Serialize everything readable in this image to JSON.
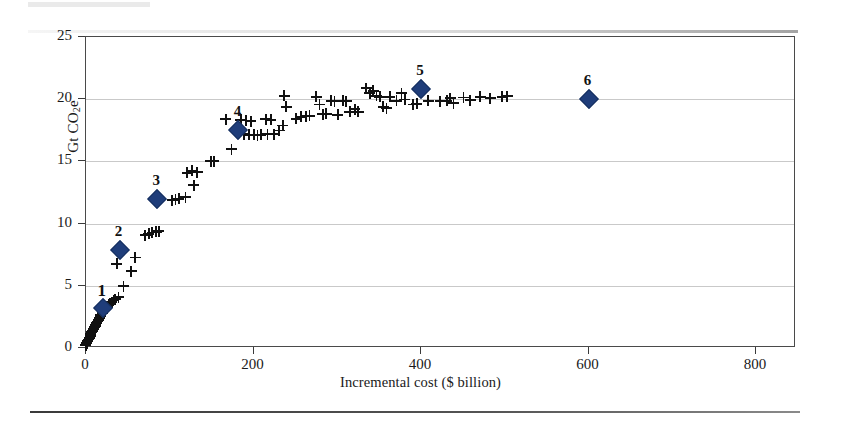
{
  "chart_data": {
    "type": "scatter",
    "title": "",
    "xlabel": "Incremental cost ($ billion)",
    "ylabel": "Gt CO2e",
    "ylabel_rich": "Gt CO<sub>2</sub>e",
    "xlim": [
      0,
      841
    ],
    "ylim": [
      0,
      25
    ],
    "xticks": [
      0,
      200,
      400,
      600,
      800
    ],
    "yticks": [
      0,
      5,
      10,
      15,
      20,
      25
    ],
    "xtick_labels": [
      "0",
      "200",
      "400",
      "600",
      "800"
    ],
    "ytick_labels": [
      "0",
      "5",
      "10",
      "15",
      "20",
      "25"
    ],
    "grid": "horizontal",
    "legend": "none",
    "series": [
      {
        "name": "abatement points",
        "marker": "plus",
        "color": "#111111",
        "points": [
          [
            1,
            0.15
          ],
          [
            2,
            0.3
          ],
          [
            3,
            0.45
          ],
          [
            4,
            0.6
          ],
          [
            5,
            0.75
          ],
          [
            6,
            0.9
          ],
          [
            7,
            1.05
          ],
          [
            8,
            1.2
          ],
          [
            9,
            1.3
          ],
          [
            10,
            1.45
          ],
          [
            11,
            1.6
          ],
          [
            12,
            1.7
          ],
          [
            13,
            1.8
          ],
          [
            14,
            1.95
          ],
          [
            15,
            2.05
          ],
          [
            16,
            2.2
          ],
          [
            17,
            2.3
          ],
          [
            18,
            2.45
          ],
          [
            19,
            2.6
          ],
          [
            21,
            2.75
          ],
          [
            22,
            2.9
          ],
          [
            24,
            3.05
          ],
          [
            26,
            3.2
          ],
          [
            28,
            3.35
          ],
          [
            30,
            3.5
          ],
          [
            32,
            3.6
          ],
          [
            34,
            3.75
          ],
          [
            36,
            3.85
          ],
          [
            40,
            4.0
          ],
          [
            38,
            6.7
          ],
          [
            46,
            4.9
          ],
          [
            55,
            6.1
          ],
          [
            60,
            7.2
          ],
          [
            72,
            9.0
          ],
          [
            76,
            9.1
          ],
          [
            80,
            9.2
          ],
          [
            85,
            9.25
          ],
          [
            88,
            9.3
          ],
          [
            104,
            11.8
          ],
          [
            108,
            11.85
          ],
          [
            112,
            11.9
          ],
          [
            120,
            12.05
          ],
          [
            122,
            14.0
          ],
          [
            128,
            14.15
          ],
          [
            134,
            14.05
          ],
          [
            130,
            13.0
          ],
          [
            150,
            14.95
          ],
          [
            154,
            14.95
          ],
          [
            168,
            18.3
          ],
          [
            175,
            15.9
          ],
          [
            186,
            18.25
          ],
          [
            192,
            18.2
          ],
          [
            198,
            18.15
          ],
          [
            190,
            17.1
          ],
          [
            196,
            17.05
          ],
          [
            202,
            17.05
          ],
          [
            206,
            17.0
          ],
          [
            210,
            17.05
          ],
          [
            216,
            18.3
          ],
          [
            222,
            18.25
          ],
          [
            218,
            17.1
          ],
          [
            226,
            17.1
          ],
          [
            238,
            20.2
          ],
          [
            240,
            19.3
          ],
          [
            236,
            17.8
          ],
          [
            232,
            17.4
          ],
          [
            252,
            18.35
          ],
          [
            258,
            18.5
          ],
          [
            264,
            18.55
          ],
          [
            268,
            18.6
          ],
          [
            276,
            20.1
          ],
          [
            280,
            19.5
          ],
          [
            284,
            18.7
          ],
          [
            288,
            18.75
          ],
          [
            294,
            19.8
          ],
          [
            298,
            19.75
          ],
          [
            302,
            18.65
          ],
          [
            308,
            19.8
          ],
          [
            312,
            19.75
          ],
          [
            316,
            18.9
          ],
          [
            322,
            19.1
          ],
          [
            326,
            18.9
          ],
          [
            336,
            20.8
          ],
          [
            340,
            20.4
          ],
          [
            344,
            20.6
          ],
          [
            348,
            20.2
          ],
          [
            352,
            20.1
          ],
          [
            356,
            19.3
          ],
          [
            360,
            19.2
          ],
          [
            364,
            20.1
          ],
          [
            372,
            19.8
          ],
          [
            378,
            20.4
          ],
          [
            382,
            19.9
          ],
          [
            392,
            19.5
          ],
          [
            396,
            19.55
          ],
          [
            410,
            19.8
          ],
          [
            424,
            19.75
          ],
          [
            432,
            19.8
          ],
          [
            436,
            20.0
          ],
          [
            440,
            19.6
          ],
          [
            452,
            20.05
          ],
          [
            460,
            19.85
          ],
          [
            472,
            20.1
          ],
          [
            484,
            20.0
          ],
          [
            498,
            20.1
          ],
          [
            504,
            20.15
          ]
        ]
      },
      {
        "name": "highlighted options",
        "marker": "diamond",
        "color": "#1f3d7a",
        "points": [
          {
            "label": "1",
            "x": 20,
            "y": 3.25
          },
          {
            "label": "2",
            "x": 40,
            "y": 7.85
          },
          {
            "label": "3",
            "x": 85,
            "y": 12.0
          },
          {
            "label": "4",
            "x": 182,
            "y": 17.5
          },
          {
            "label": "5",
            "x": 400,
            "y": 20.8
          },
          {
            "label": "6",
            "x": 600,
            "y": 20.0
          }
        ]
      }
    ]
  },
  "figure": {
    "footer_rule": true
  }
}
